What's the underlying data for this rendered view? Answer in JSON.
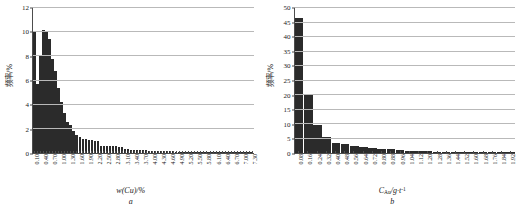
{
  "figure": {
    "panels": [
      {
        "letter": "a",
        "xlabel_main": "w(Cu)",
        "xlabel_unit": "/%",
        "ylabel": "频率/%"
      },
      {
        "letter": "b",
        "xlabel_main": "C",
        "xlabel_sub": "Au",
        "xlabel_unit": "/g·t",
        "xlabel_sup": "-1",
        "ylabel": "频率/%"
      }
    ]
  },
  "chart_data": [
    {
      "type": "bar",
      "title": "",
      "subfigure": "a",
      "xlabel": "w(Cu)/%",
      "ylabel": "频率/%",
      "ylim": [
        0,
        12
      ],
      "yticks": [
        0,
        2,
        4,
        6,
        8,
        10,
        12
      ],
      "grid": true,
      "legend": "none",
      "xtick_step": 3,
      "xtick_labels": [
        "0.10",
        "0.40",
        "0.70",
        "1.00",
        "1.30",
        "1.60",
        "1.90",
        "2.20",
        "2.50",
        "2.80",
        "3.10",
        "3.40",
        "3.70",
        "4.00",
        "4.30",
        "4.60",
        "4.90",
        "5.20",
        "5.50",
        "5.80",
        "6.10",
        "6.40",
        "6.70",
        "7.00",
        "7.30"
      ],
      "categories": [
        "0.10",
        "0.20",
        "0.30",
        "0.40",
        "0.50",
        "0.60",
        "0.70",
        "0.80",
        "0.90",
        "1.00",
        "1.10",
        "1.20",
        "1.30",
        "1.40",
        "1.50",
        "1.60",
        "1.70",
        "1.80",
        "1.90",
        "2.00",
        "2.10",
        "2.20",
        "2.30",
        "2.40",
        "2.50",
        "2.60",
        "2.70",
        "2.80",
        "2.90",
        "3.00",
        "3.10",
        "3.20",
        "3.30",
        "3.40",
        "3.50",
        "3.60",
        "3.70",
        "3.80",
        "3.90",
        "4.00",
        "4.10",
        "4.20",
        "4.30",
        "4.40",
        "4.50",
        "4.60",
        "4.70",
        "4.80",
        "4.90",
        "5.00",
        "5.10",
        "5.20",
        "5.30",
        "5.40",
        "5.50",
        "5.60",
        "5.70",
        "5.80",
        "5.90",
        "6.00",
        "6.10",
        "6.20",
        "6.30",
        "6.40",
        "6.50",
        "6.60",
        "6.70",
        "6.80",
        "6.90",
        "7.00",
        "7.10",
        "7.20",
        "7.30"
      ],
      "values": [
        10.1,
        5.75,
        8.15,
        10.2,
        10.0,
        9.45,
        7.75,
        6.8,
        5.35,
        4.25,
        3.35,
        2.6,
        2.3,
        1.85,
        1.45,
        1.3,
        1.15,
        1.15,
        1.1,
        1.05,
        1.0,
        0.98,
        0.6,
        0.58,
        0.57,
        0.56,
        0.55,
        0.54,
        0.52,
        0.5,
        0.35,
        0.3,
        0.28,
        0.27,
        0.26,
        0.25,
        0.24,
        0.22,
        0.2,
        0.2,
        0.18,
        0.17,
        0.16,
        0.15,
        0.15,
        0.14,
        0.13,
        0.12,
        0.12,
        0.11,
        0.1,
        0.1,
        0.09,
        0.09,
        0.08,
        0.08,
        0.07,
        0.07,
        0.06,
        0.06,
        0.05,
        0.05,
        0.05,
        0.04,
        0.04,
        0.04,
        0.03,
        0.03,
        0.03,
        0.02,
        0.02,
        0.02,
        0.02
      ]
    },
    {
      "type": "bar",
      "title": "",
      "subfigure": "b",
      "xlabel": "C_Au/g·t^-1",
      "ylabel": "频率/%",
      "ylim": [
        0,
        50
      ],
      "yticks": [
        0,
        5,
        10,
        15,
        20,
        25,
        30,
        35,
        40,
        45,
        50
      ],
      "grid": true,
      "legend": "none",
      "xtick_step": 1,
      "xtick_labels": [
        "0.08",
        "0.16",
        "0.24",
        "0.32",
        "0.40",
        "0.48",
        "0.56",
        "0.64",
        "0.72",
        "0.80",
        "0.88",
        "0.96",
        "1.04",
        "1.12",
        "1.20",
        "1.28",
        "1.36",
        "1.44",
        "1.52",
        "1.60",
        "1.68",
        "1.76",
        "1.84",
        "1.92"
      ],
      "categories": [
        "0.08",
        "0.16",
        "0.24",
        "0.32",
        "0.40",
        "0.48",
        "0.56",
        "0.64",
        "0.72",
        "0.80",
        "0.88",
        "0.96",
        "1.04",
        "1.12",
        "1.20",
        "1.28",
        "1.36",
        "1.44",
        "1.52",
        "1.60",
        "1.68",
        "1.76",
        "1.84",
        "1.92"
      ],
      "values": [
        46.5,
        20.3,
        9.5,
        5.5,
        3.3,
        3.0,
        2.5,
        2.2,
        1.6,
        1.5,
        1.3,
        0.9,
        0.85,
        0.7,
        0.6,
        0.5,
        0.45,
        0.4,
        0.35,
        0.3,
        0.25,
        0.22,
        0.2,
        0.5
      ]
    }
  ]
}
